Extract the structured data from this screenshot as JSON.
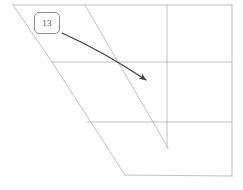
{
  "canvas": {
    "width": 243,
    "height": 190,
    "background": "#ffffff"
  },
  "diagram": {
    "kind": "perspective-wireframe-floorplan",
    "line_color": "#b0b0b0",
    "line_width": 0.8,
    "segments": [
      {
        "name": "top-edge",
        "x1": 13,
        "y1": 5,
        "x2": 232,
        "y2": 5
      },
      {
        "name": "right-edge",
        "x1": 232,
        "y1": 5,
        "x2": 232,
        "y2": 176
      },
      {
        "name": "left-diagonal-upper",
        "x1": 13,
        "y1": 5,
        "x2": 52,
        "y2": 62
      },
      {
        "name": "left-diagonal-lower",
        "x1": 52,
        "y1": 62,
        "x2": 125,
        "y2": 175
      },
      {
        "name": "inner-diagonal",
        "x1": 85,
        "y1": 5,
        "x2": 168,
        "y2": 148
      },
      {
        "name": "mid-horizontal",
        "x1": 52,
        "y1": 62,
        "x2": 232,
        "y2": 62
      },
      {
        "name": "lower-horizontal",
        "x1": 87,
        "y1": 122,
        "x2": 232,
        "y2": 122
      },
      {
        "name": "vertical-divider",
        "x1": 167,
        "y1": 5,
        "x2": 167,
        "y2": 148
      },
      {
        "name": "bottom-edge",
        "x1": 125,
        "y1": 175,
        "x2": 232,
        "y2": 176
      }
    ]
  },
  "annotation": {
    "arrow_color": "#3a3a3a",
    "arrow_width": 1.2,
    "arrow": {
      "name": "pointer-arrow",
      "start_x": 62,
      "start_y": 33,
      "end_x": 146,
      "end_y": 80,
      "curve_cx": 104,
      "curve_cy": 52
    },
    "callout": {
      "label": "13",
      "box_x": 34,
      "box_y": 12,
      "box_width": 26,
      "box_height": 22,
      "border_color": "#8c8c8c",
      "text_color": "#4a4a4a",
      "background": "#ffffff"
    }
  }
}
